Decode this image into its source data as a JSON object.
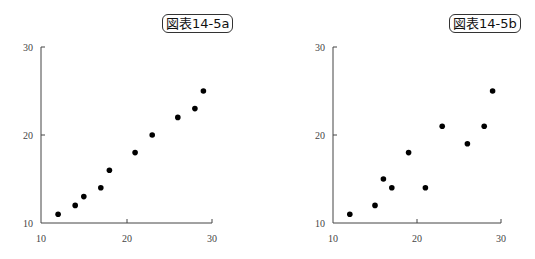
{
  "chart_data": [
    {
      "type": "scatter",
      "title": "図表14-5a",
      "xlabel": "",
      "ylabel": "",
      "xlim": [
        10,
        30
      ],
      "ylim": [
        10,
        30
      ],
      "xticks": [
        10,
        20,
        30
      ],
      "yticks": [
        10,
        20,
        30
      ],
      "grid": false,
      "points": [
        {
          "x": 12,
          "y": 11
        },
        {
          "x": 14,
          "y": 12
        },
        {
          "x": 15,
          "y": 13
        },
        {
          "x": 17,
          "y": 14
        },
        {
          "x": 18,
          "y": 16
        },
        {
          "x": 21,
          "y": 18
        },
        {
          "x": 23,
          "y": 20
        },
        {
          "x": 26,
          "y": 22
        },
        {
          "x": 28,
          "y": 23
        },
        {
          "x": 29,
          "y": 25
        }
      ]
    },
    {
      "type": "scatter",
      "title": "図表14-5b",
      "xlabel": "",
      "ylabel": "",
      "xlim": [
        10,
        30
      ],
      "ylim": [
        10,
        30
      ],
      "xticks": [
        10,
        20,
        30
      ],
      "yticks": [
        10,
        20,
        30
      ],
      "grid": false,
      "points": [
        {
          "x": 12,
          "y": 11
        },
        {
          "x": 15,
          "y": 12
        },
        {
          "x": 16,
          "y": 15
        },
        {
          "x": 17,
          "y": 14
        },
        {
          "x": 19,
          "y": 18
        },
        {
          "x": 21,
          "y": 14
        },
        {
          "x": 23,
          "y": 21
        },
        {
          "x": 26,
          "y": 19
        },
        {
          "x": 28,
          "y": 21
        },
        {
          "x": 29,
          "y": 25
        }
      ]
    }
  ],
  "charts": [
    {
      "title": "図表14-5a",
      "tick_labels": {
        "x": [
          "10",
          "20",
          "30"
        ],
        "y": [
          "10",
          "20",
          "30"
        ]
      }
    },
    {
      "title": "図表14-5b",
      "tick_labels": {
        "x": [
          "10",
          "20",
          "30"
        ],
        "y": [
          "10",
          "20",
          "30"
        ]
      }
    }
  ],
  "style": {
    "axis_color": "#444444",
    "point_color": "#000000"
  }
}
